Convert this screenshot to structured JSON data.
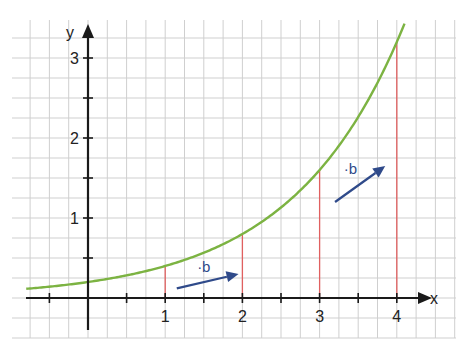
{
  "chart_data": {
    "type": "line",
    "title": "",
    "xlabel": "x",
    "ylabel": "y",
    "xlim": [
      -1,
      4.5
    ],
    "ylim": [
      -0.5,
      3.5
    ],
    "grid": true,
    "grid_step": 0.25,
    "x_ticks": [
      -0.5,
      0,
      0.5,
      1,
      1.5,
      2,
      2.5,
      3,
      3.5,
      4
    ],
    "x_tick_labels": [
      {
        "value": 1,
        "text": "1"
      },
      {
        "value": 2,
        "text": "2"
      },
      {
        "value": 3,
        "text": "3"
      },
      {
        "value": 4,
        "text": "4"
      }
    ],
    "y_ticks": [
      0.5,
      1,
      1.5,
      2,
      2.5,
      3
    ],
    "y_tick_labels": [
      {
        "value": 1,
        "text": "1"
      },
      {
        "value": 2,
        "text": "2"
      },
      {
        "value": 3,
        "text": "3"
      }
    ],
    "series": [
      {
        "name": "f(x) = 0.2·2^x",
        "a": 0.2,
        "b": 2,
        "x_start": -0.8,
        "x_end": 4.1,
        "color": "#7cb342"
      }
    ],
    "points": [
      {
        "x": 1,
        "y": 0.4
      },
      {
        "x": 2,
        "y": 0.8
      },
      {
        "x": 3,
        "y": 1.6
      },
      {
        "x": 4,
        "y": 3.2
      }
    ],
    "vertical_lines_color": "#e06060",
    "annotations": [
      {
        "text": "·b",
        "x": 1.5,
        "y": 0.33,
        "arrow_from": [
          1.15,
          0.12
        ],
        "arrow_to": [
          1.95,
          0.3
        ]
      },
      {
        "text": "·b",
        "x": 3.4,
        "y": 1.55,
        "arrow_from": [
          3.2,
          1.2
        ],
        "arrow_to": [
          3.85,
          1.65
        ]
      }
    ],
    "arrow_color": "#2f4a8a",
    "axis_color": "#1a1a1a"
  }
}
